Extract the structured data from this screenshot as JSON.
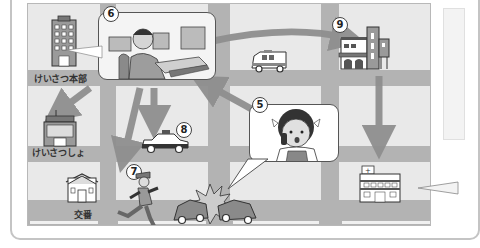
{
  "diagram": {
    "type": "emergency-response-flow-map",
    "nodes": [
      {
        "id": "police-hq",
        "label": "けいさつ本部"
      },
      {
        "id": "police-station",
        "label": "けいさつしょ"
      },
      {
        "id": "koban",
        "label": "交番"
      },
      {
        "id": "fire-station",
        "number": "⑨"
      },
      {
        "id": "hospital"
      },
      {
        "id": "operator",
        "number": "⑥"
      },
      {
        "id": "caller-girl",
        "number": "⑤"
      },
      {
        "id": "officer-running",
        "number": "⑦"
      },
      {
        "id": "patrol-car",
        "number": "⑧"
      },
      {
        "id": "ambulance"
      },
      {
        "id": "car-accident"
      }
    ],
    "edges": [
      {
        "from": "caller-girl",
        "to": "operator"
      },
      {
        "from": "operator",
        "to": "fire-station"
      },
      {
        "from": "police-hq",
        "to": "police-station"
      },
      {
        "from": "police-hq",
        "to": "koban"
      },
      {
        "from": "police-hq",
        "to": "patrol-car"
      },
      {
        "from": "fire-station",
        "to": "hospital"
      }
    ]
  },
  "labels": {
    "police_hq": "けいさつ本部",
    "police_station": "けいさつしょ",
    "koban": "交番"
  },
  "numbers": {
    "n5": "5",
    "n6": "6",
    "n7": "7",
    "n8": "8",
    "n9": "9"
  },
  "colors": {
    "block": "#e9e9e9",
    "road": "#b3b3b3",
    "arrow": "#8f8f8f",
    "outline": "#444444"
  }
}
